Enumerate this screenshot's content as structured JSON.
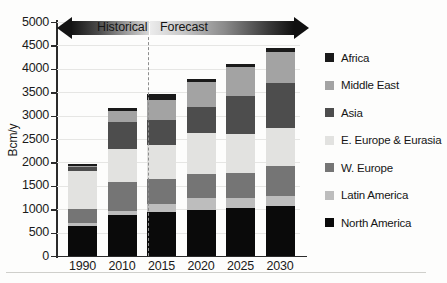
{
  "chart_data": {
    "type": "bar",
    "stacked": true,
    "title": "",
    "xlabel": "",
    "ylabel": "Bcm/y",
    "ylim": [
      0,
      5000
    ],
    "ytick_step": 500,
    "yticks": [
      0,
      500,
      1000,
      1500,
      2000,
      2500,
      3000,
      3500,
      4000,
      4500,
      5000
    ],
    "grid": true,
    "legend_position": "right",
    "categories": [
      "1990",
      "2010",
      "2015",
      "2020",
      "2025",
      "2030"
    ],
    "series": [
      {
        "name": "North America",
        "color": "#0a0a0a",
        "values": [
          640,
          870,
          940,
          990,
          1030,
          1070
        ]
      },
      {
        "name": "Latin America",
        "color": "#bdbdbd",
        "values": [
          60,
          90,
          170,
          240,
          200,
          220
        ]
      },
      {
        "name": "W. Europe",
        "color": "#757575",
        "values": [
          310,
          620,
          540,
          530,
          540,
          640
        ]
      },
      {
        "name": "E. Europe & Eurasia",
        "color": "#e2e2e0",
        "values": [
          800,
          700,
          730,
          860,
          840,
          810
        ]
      },
      {
        "name": "Asia",
        "color": "#4d4d4d",
        "values": [
          90,
          590,
          520,
          570,
          820,
          960
        ]
      },
      {
        "name": "Middle East",
        "color": "#a3a3a3",
        "values": [
          25,
          220,
          440,
          520,
          600,
          650
        ]
      },
      {
        "name": "Africa",
        "color": "#1a1a1a",
        "values": [
          35,
          70,
          120,
          80,
          80,
          100
        ]
      }
    ],
    "totals": [
      1960,
      3160,
      3460,
      3790,
      4110,
      4450
    ],
    "annotations": [
      {
        "text": "Historical",
        "direction": "left"
      },
      {
        "text": "Forecast",
        "direction": "right"
      }
    ]
  },
  "axis": {
    "y_label": "Bcm/y",
    "y_ticks": [
      "5000",
      "4500",
      "4000",
      "3500",
      "3000",
      "2500",
      "2000",
      "1500",
      "1000",
      "500",
      "0"
    ],
    "x_ticks": [
      "1990",
      "2010",
      "2015",
      "2020",
      "2025",
      "2030"
    ]
  },
  "arrows": {
    "historical": "Historical",
    "forecast": "Forecast"
  },
  "legend": {
    "items": [
      {
        "label": "Africa",
        "color": "#1a1a1a"
      },
      {
        "label": "Middle East",
        "color": "#a3a3a3"
      },
      {
        "label": "Asia",
        "color": "#4d4d4d"
      },
      {
        "label": "E. Europe & Eurasia",
        "color": "#e2e2e0"
      },
      {
        "label": "W. Europe",
        "color": "#757575"
      },
      {
        "label": "Latin America",
        "color": "#bdbdbd"
      },
      {
        "label": "North America",
        "color": "#0a0a0a"
      }
    ]
  }
}
